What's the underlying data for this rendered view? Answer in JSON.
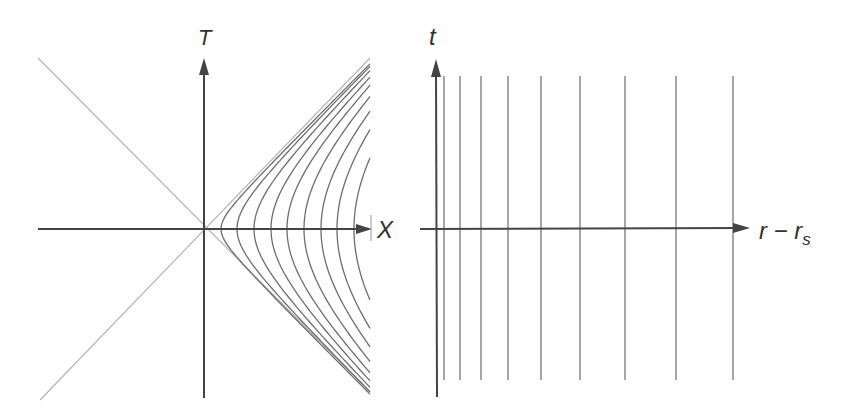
{
  "figure": {
    "left_panel": {
      "name": "Kruskal-Szekeres diagram",
      "x_axis_label": "X",
      "y_axis_label": "T",
      "origin": [
        204,
        229
      ],
      "axis_color": "#444444",
      "lightcone_color": "#b5b5b5",
      "curve_color": "#6e6e6e",
      "hyperbola_vertices_px": [
        221,
        237,
        254,
        271,
        287,
        304,
        321,
        337,
        354
      ],
      "right_clip_x": 370,
      "top_y": 58,
      "bottom_y": 398
    },
    "right_panel": {
      "name": "Schwarzschild coordinates",
      "x_axis_label_main": "r − r",
      "x_axis_label_sub": "s",
      "y_axis_label": "t",
      "origin": [
        436,
        229
      ],
      "axis_color": "#444444",
      "line_color": "#777777",
      "vertical_lines_px": [
        444,
        460,
        481,
        508,
        541,
        580,
        625,
        676,
        733
      ],
      "line_top_y": 76,
      "line_bottom_y": 380
    }
  }
}
